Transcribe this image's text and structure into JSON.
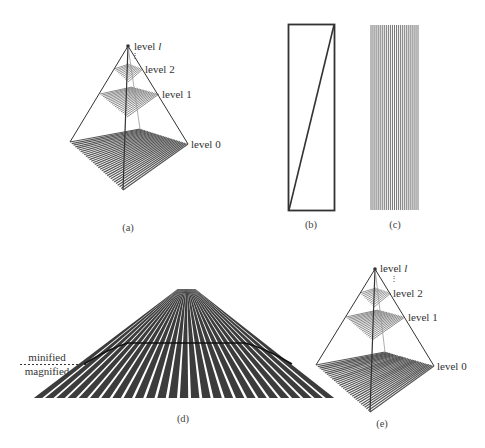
{
  "panels": {
    "a": {
      "caption": "(a)",
      "levels": [
        "level l",
        "level 2",
        "level 1",
        "level 0"
      ],
      "level_l_prefix": "level ",
      "level_l_var": "l"
    },
    "b": {
      "caption": "(b)"
    },
    "c": {
      "caption": "(c)"
    },
    "d": {
      "caption": "(d)",
      "minified_label": "minified",
      "magnified_label": "magnified"
    },
    "e": {
      "caption": "(e)",
      "levels": [
        "level l",
        "level 2",
        "level 1",
        "level 0"
      ],
      "level_l_prefix": "level ",
      "level_l_var": "l"
    }
  },
  "colors": {
    "line": "#333333",
    "stripe": "#555555",
    "stripe_light": "#8a8a8a"
  }
}
